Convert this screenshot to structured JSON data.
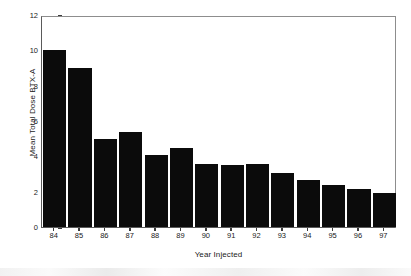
{
  "chart_data": {
    "type": "bar",
    "title": "",
    "xlabel": "Year Injected",
    "ylabel": "Mean Total Dose BTX-A",
    "categories": [
      "84",
      "85",
      "86",
      "87",
      "88",
      "89",
      "90",
      "91",
      "92",
      "93",
      "94",
      "95",
      "96",
      "97"
    ],
    "values": [
      10.0,
      9.0,
      5.0,
      5.4,
      4.05,
      4.45,
      3.55,
      3.5,
      3.55,
      3.05,
      2.65,
      2.35,
      2.15,
      1.9
    ],
    "ylim": [
      0,
      12
    ],
    "yticks": [
      "0",
      "2",
      "4",
      "6",
      "8",
      "10",
      "12"
    ],
    "ytick_values": [
      0,
      2,
      4,
      6,
      8,
      10,
      12
    ],
    "grid": false,
    "legend": "none",
    "bar_color": "#0b0b0b",
    "axis_color": "#5a5a5a",
    "background_color": "#ffffff"
  }
}
